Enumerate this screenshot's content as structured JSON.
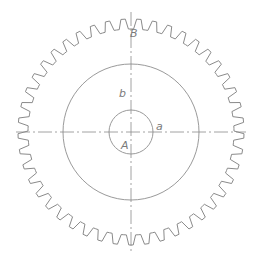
{
  "diagram": {
    "type": "gear",
    "center": {
      "x": 131,
      "y": 132
    },
    "gear": {
      "teeth": 45,
      "outer_radius": 113,
      "root_radius": 103,
      "stroke": "#8a8a8a"
    },
    "circles": [
      {
        "name": "pitch-circle",
        "r": 68,
        "stroke": "#9a9a9a"
      },
      {
        "name": "hub-circle",
        "r": 22,
        "stroke": "#9a9a9a"
      }
    ],
    "centerlines": {
      "horizontal": {
        "x1": 16,
        "x2": 246
      },
      "vertical": {
        "y1": 12,
        "y2": 252
      },
      "stroke": "#8a8a8a"
    },
    "labels": [
      {
        "id": "B",
        "text": "B",
        "x": 130,
        "y": 37
      },
      {
        "id": "b",
        "text": "b",
        "x": 119,
        "y": 97
      },
      {
        "id": "a",
        "text": "a",
        "x": 156,
        "y": 130
      },
      {
        "id": "A",
        "text": "A",
        "x": 121,
        "y": 149
      }
    ]
  }
}
